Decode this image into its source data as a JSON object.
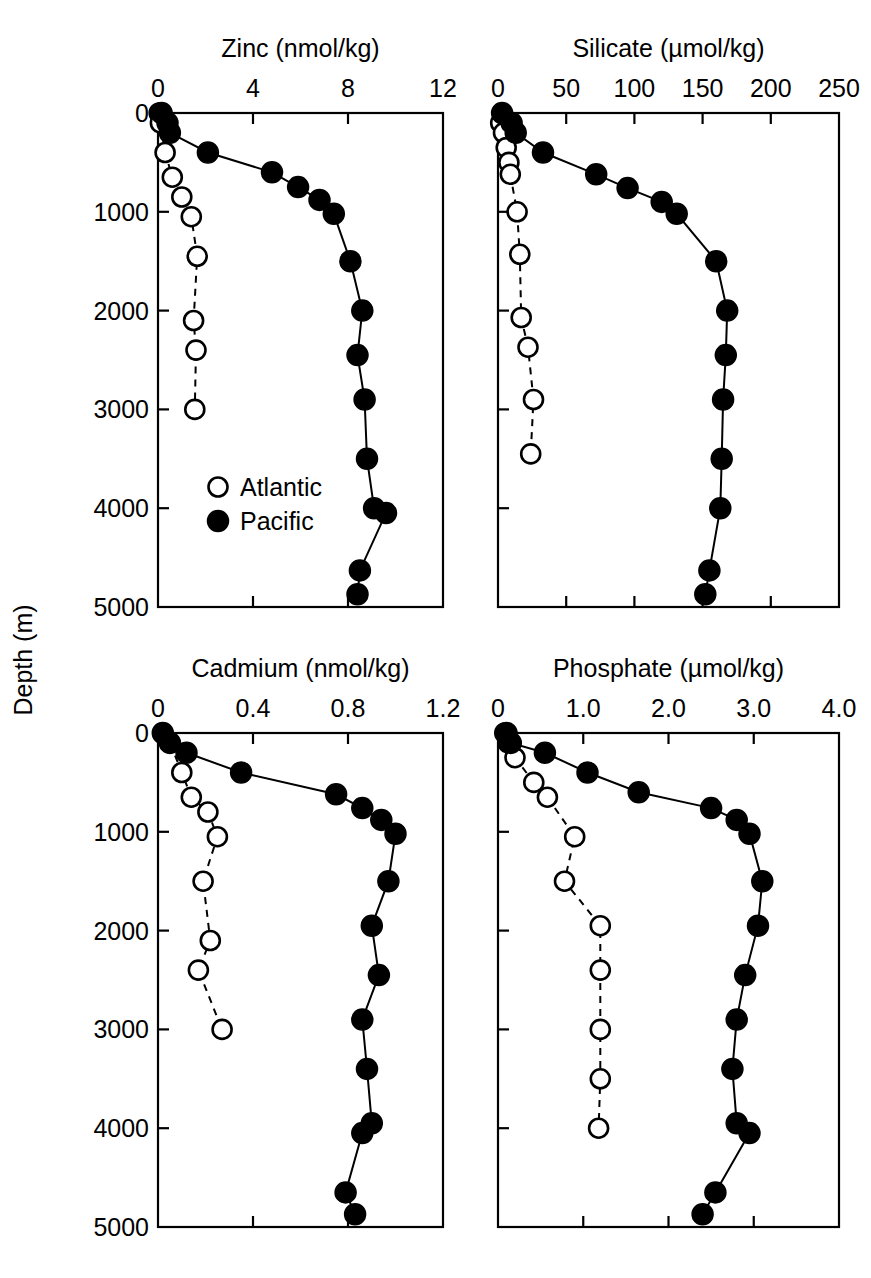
{
  "figure": {
    "y_axis_label": "Depth (m)",
    "depth_ticks": [
      0,
      1000,
      2000,
      3000,
      4000,
      5000
    ],
    "depth_range": [
      0,
      5000
    ]
  },
  "legend": {
    "position": "top-left-panel-lower-left",
    "entries": [
      {
        "label": "Atlantic",
        "marker": "open-circle"
      },
      {
        "label": "Pacific",
        "marker": "filled-circle"
      }
    ]
  },
  "chart_data": [
    {
      "type": "line",
      "panel": "top-left",
      "title": "Zinc (nmol/kg)",
      "xlabel": "Zinc (nmol/kg)",
      "ylabel": "Depth (m)",
      "xlim": [
        0,
        12
      ],
      "ylim": [
        0,
        5000
      ],
      "y_inverted": true,
      "xticks": [
        0,
        4,
        8,
        12
      ],
      "xtick_labels": [
        "0",
        "4",
        "8",
        "12"
      ],
      "yticks": [
        0,
        1000,
        2000,
        3000,
        4000,
        5000
      ],
      "ytick_labels": [
        "0",
        "1000",
        "2000",
        "3000",
        "4000",
        "5000"
      ],
      "grid": false,
      "legend": [
        "Atlantic",
        "Pacific"
      ],
      "series": [
        {
          "name": "Atlantic",
          "marker": "open-circle",
          "linestyle": "dashed",
          "x": [
            0.05,
            0.1,
            0.3,
            0.6,
            1.0,
            1.4,
            1.65,
            1.5,
            1.6,
            1.55
          ],
          "depth": [
            0,
            100,
            400,
            650,
            850,
            1050,
            1450,
            2100,
            2400,
            3000
          ]
        },
        {
          "name": "Pacific",
          "marker": "filled-circle",
          "linestyle": "solid",
          "x": [
            0.15,
            0.4,
            0.5,
            2.1,
            4.8,
            5.9,
            6.8,
            7.4,
            8.1,
            8.6,
            8.4,
            8.7,
            8.8,
            9.1,
            9.6,
            8.5,
            8.4
          ],
          "depth": [
            0,
            100,
            200,
            400,
            600,
            750,
            880,
            1020,
            1500,
            2000,
            2450,
            2900,
            3500,
            4000,
            4050,
            4630,
            4870
          ]
        }
      ]
    },
    {
      "type": "line",
      "panel": "top-right",
      "title": "Silicate (µmol/kg)",
      "xlabel": "Silicate (µmol/kg)",
      "ylabel": "Depth (m)",
      "xlim": [
        0,
        250
      ],
      "ylim": [
        0,
        5000
      ],
      "y_inverted": true,
      "xticks": [
        0,
        50,
        100,
        150,
        200,
        250
      ],
      "xtick_labels": [
        "0",
        "50",
        "100",
        "150",
        "200",
        "250"
      ],
      "yticks": [
        0,
        1000,
        2000,
        3000,
        4000,
        5000
      ],
      "ytick_labels": [
        "0",
        "1000",
        "2000",
        "3000",
        "4000",
        "5000"
      ],
      "grid": false,
      "legend": [
        "Atlantic",
        "Pacific"
      ],
      "series": [
        {
          "name": "Atlantic",
          "marker": "open-circle",
          "linestyle": "dashed",
          "x": [
            2,
            4,
            6,
            8,
            9,
            14,
            16,
            17,
            22,
            26,
            24
          ],
          "depth": [
            100,
            200,
            350,
            500,
            620,
            1000,
            1430,
            2070,
            2370,
            2900,
            3450,
            4000
          ]
        },
        {
          "name": "Pacific",
          "marker": "filled-circle",
          "linestyle": "solid",
          "x": [
            3,
            10,
            13,
            33,
            72,
            95,
            120,
            131,
            160,
            168,
            167,
            165,
            164,
            163,
            155,
            152
          ],
          "depth": [
            0,
            100,
            200,
            400,
            620,
            760,
            900,
            1020,
            1500,
            2000,
            2450,
            2900,
            3500,
            4000,
            4630,
            4870
          ]
        }
      ]
    },
    {
      "type": "line",
      "panel": "bottom-left",
      "title": "Cadmium (nmol/kg)",
      "xlabel": "Cadmium (nmol/kg)",
      "ylabel": "Depth (m)",
      "xlim": [
        0,
        1.2
      ],
      "ylim": [
        0,
        5000
      ],
      "y_inverted": true,
      "xticks": [
        0,
        0.4,
        0.8,
        1.2
      ],
      "xtick_labels": [
        "0",
        "0.4",
        "0.8",
        "1.2"
      ],
      "yticks": [
        0,
        1000,
        2000,
        3000,
        4000,
        5000
      ],
      "ytick_labels": [
        "0",
        "1000",
        "2000",
        "3000",
        "4000",
        "5000"
      ],
      "grid": false,
      "legend": [
        "Atlantic",
        "Pacific"
      ],
      "series": [
        {
          "name": "Atlantic",
          "marker": "open-circle",
          "linestyle": "dashed",
          "x": [
            0.02,
            0.05,
            0.1,
            0.14,
            0.21,
            0.25,
            0.19,
            0.22,
            0.17,
            0.27
          ],
          "depth": [
            0,
            100,
            400,
            650,
            800,
            1050,
            1500,
            2100,
            2400,
            3000
          ]
        },
        {
          "name": "Pacific",
          "marker": "filled-circle",
          "linestyle": "solid",
          "x": [
            0.02,
            0.05,
            0.12,
            0.35,
            0.75,
            0.86,
            0.94,
            1.0,
            0.97,
            0.9,
            0.93,
            0.86,
            0.88,
            0.9,
            0.86,
            0.79,
            0.83
          ],
          "depth": [
            0,
            100,
            200,
            400,
            620,
            760,
            880,
            1020,
            1500,
            1950,
            2450,
            2900,
            3400,
            3950,
            4050,
            4650,
            4870
          ]
        }
      ]
    },
    {
      "type": "line",
      "panel": "bottom-right",
      "title": "Phosphate (µmol/kg)",
      "xlabel": "Phosphate (µmol/kg)",
      "ylabel": "Depth (m)",
      "xlim": [
        0,
        4.0
      ],
      "ylim": [
        0,
        5000
      ],
      "y_inverted": true,
      "xticks": [
        0,
        1.0,
        2.0,
        3.0,
        4.0
      ],
      "xtick_labels": [
        "0",
        "1.0",
        "2.0",
        "3.0",
        "4.0"
      ],
      "yticks": [
        0,
        1000,
        2000,
        3000,
        4000,
        5000
      ],
      "ytick_labels": [
        "0",
        "1000",
        "2000",
        "3000",
        "4000",
        "5000"
      ],
      "grid": false,
      "legend": [
        "Atlantic",
        "Pacific"
      ],
      "series": [
        {
          "name": "Atlantic",
          "marker": "open-circle",
          "linestyle": "dashed",
          "x": [
            0.08,
            0.12,
            0.2,
            0.42,
            0.58,
            0.9,
            0.78,
            1.2,
            1.2,
            1.2,
            1.2,
            1.18
          ],
          "depth": [
            0,
            100,
            250,
            500,
            650,
            1050,
            1500,
            1950,
            2400,
            3000,
            3500,
            4000
          ]
        },
        {
          "name": "Pacific",
          "marker": "filled-circle",
          "linestyle": "solid",
          "x": [
            0.1,
            0.15,
            0.55,
            1.05,
            1.65,
            2.5,
            2.8,
            2.95,
            3.1,
            3.05,
            2.9,
            2.8,
            2.75,
            2.8,
            2.95,
            2.55,
            2.4
          ],
          "depth": [
            0,
            100,
            200,
            400,
            600,
            760,
            880,
            1020,
            1500,
            1950,
            2450,
            2900,
            3400,
            3950,
            4050,
            4650,
            4870
          ]
        }
      ]
    }
  ]
}
